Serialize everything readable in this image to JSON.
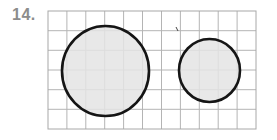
{
  "problem": {
    "number_label": "14."
  },
  "grid": {
    "x": 48,
    "y": 11,
    "width": 208,
    "height": 118,
    "columns": 11,
    "rows": 6,
    "line_color": "#b4b4b4",
    "border_color": "#a8a8a8"
  },
  "shapes": {
    "large_circle": {
      "cx": 105.5,
      "cy": 71,
      "rx": 43.5,
      "ry": 45,
      "fill": "#e4e4e4",
      "stroke": "#151515"
    },
    "small_circle": {
      "cx": 209.5,
      "cy": 70.5,
      "rx": 30.5,
      "ry": 31.5,
      "fill": "#e4e4e4",
      "stroke": "#151515"
    }
  },
  "stray_mark": {
    "x1": 176,
    "y1": 27,
    "x2": 178,
    "y2": 31,
    "color": "#444444"
  }
}
